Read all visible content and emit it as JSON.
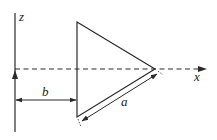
{
  "diagram": {
    "axes": {
      "z_label": "z",
      "x_label": "x"
    },
    "dimensions": {
      "b_label": "b",
      "a_label": "a"
    },
    "colors": {
      "stroke": "#2a2a2a",
      "background": "#ffffff"
    }
  }
}
